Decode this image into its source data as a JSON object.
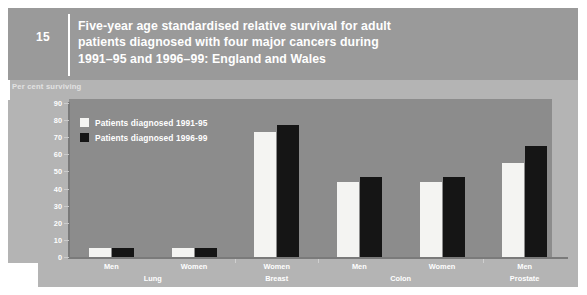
{
  "header": {
    "number": "15",
    "title_lines": [
      "Five-year age standardised relative survival for adult",
      "patients diagnosed with four major cancers during",
      "1991–95 and 1996–99: England and Wales"
    ]
  },
  "axis_caption": "Per cent surviving",
  "colors": {
    "page_background": "#ffffff",
    "outer_panel": "#b4b4b4",
    "header_band": "#9a9a9a",
    "plot_panel": "#8c8c8c",
    "series_1991_95": "#f4f4f2",
    "series_1996_99": "#151515",
    "text": "#ffffff",
    "axis_line": "#7a7a7a"
  },
  "chart_data": {
    "type": "bar",
    "title": "Five-year age standardised relative survival for adult patients diagnosed with four major cancers during 1991–95 and 1996–99: England and Wales",
    "subtitle": "",
    "xlabel": "",
    "ylabel": "Per cent surviving",
    "ylim": [
      0,
      90
    ],
    "yticks": [
      0,
      10,
      20,
      30,
      40,
      50,
      60,
      70,
      80,
      90
    ],
    "ytick_labels": [
      "0",
      "10",
      "20",
      "30",
      "40",
      "50",
      "60",
      "70",
      "80",
      "90"
    ],
    "grid": false,
    "legend_position": "top-left",
    "categories": [
      "Men",
      "Women",
      "Women",
      "Men",
      "Women",
      "Men"
    ],
    "groups": [
      {
        "name": "Lung",
        "categories": [
          "Men",
          "Women"
        ]
      },
      {
        "name": "Breast",
        "categories": [
          "Women"
        ]
      },
      {
        "name": "Colon",
        "categories": [
          "Men",
          "Women"
        ]
      },
      {
        "name": "Prostate",
        "categories": [
          "Men"
        ]
      }
    ],
    "series": [
      {
        "name": "Patients diagnosed 1991-95",
        "color": "#f4f4f2",
        "values": [
          5,
          5,
          73,
          44,
          44,
          55
        ]
      },
      {
        "name": "Patients diagnosed 1996-99",
        "color": "#151515",
        "values": [
          5,
          5,
          77,
          47,
          47,
          65
        ]
      }
    ]
  }
}
